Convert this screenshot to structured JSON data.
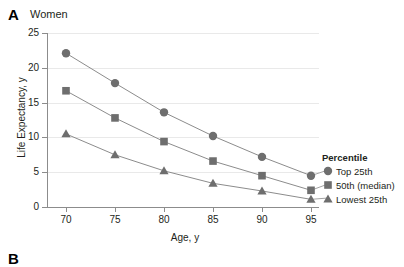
{
  "panel": {
    "letter": "A",
    "title": "Women",
    "next_panel_letter": "B",
    "next_panel_title": "Men"
  },
  "legend": {
    "title": "Percentile",
    "entries": [
      {
        "label": "Top 25th",
        "marker": "circle-marker"
      },
      {
        "label": "50th (median)",
        "marker": "square-marker"
      },
      {
        "label": "Lowest 25th",
        "marker": "triangle-marker"
      }
    ]
  },
  "colors": {
    "marker": "#6e6e6e",
    "line": "#8c8c8c",
    "axis": "#8c8c8c",
    "grid": "#e9e9e9",
    "text": "#231f20"
  },
  "chart_data": {
    "type": "line",
    "title": "Women",
    "xlabel": "Age, y",
    "ylabel": "Life Expectancy, y",
    "x": [
      70,
      75,
      80,
      85,
      90,
      95
    ],
    "xticklabels": [
      "70",
      "75",
      "80",
      "85",
      "90",
      "95"
    ],
    "yticklabels": [
      "0",
      "5",
      "10",
      "15",
      "20",
      "25"
    ],
    "yticks": [
      0,
      5,
      10,
      15,
      20,
      25
    ],
    "xlim": [
      67.5,
      96.5
    ],
    "ylim": [
      0,
      25
    ],
    "grid": "horizontal",
    "legend_position": "right",
    "series": [
      {
        "name": "Top 25th",
        "marker": "circle",
        "values": [
          22.1,
          17.8,
          13.6,
          10.2,
          7.2,
          4.5
        ]
      },
      {
        "name": "50th (median)",
        "marker": "square",
        "values": [
          16.7,
          12.8,
          9.4,
          6.6,
          4.5,
          2.4
        ]
      },
      {
        "name": "Lowest 25th",
        "marker": "triangle",
        "values": [
          10.5,
          7.5,
          5.2,
          3.4,
          2.3,
          1.1
        ]
      }
    ]
  }
}
